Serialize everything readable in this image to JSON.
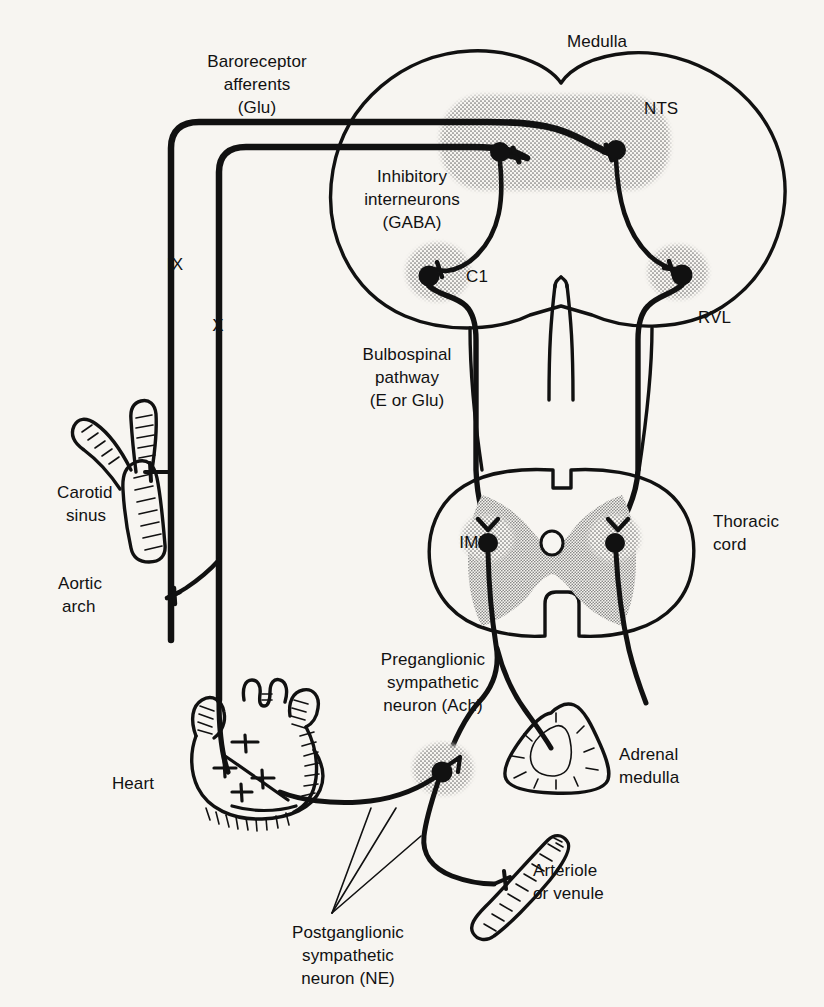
{
  "figure": {
    "background_color": "#f7f5f1",
    "ink_color": "#111111",
    "stipple_color": "#8a8a8a"
  },
  "labels": {
    "medulla": "Medulla",
    "nts": "NTS",
    "rvl": "RVL",
    "c1": "C1",
    "iml": "IML",
    "ix": "IX",
    "x": "X",
    "baroreceptor_afferents_line1": "Baroreceptor",
    "baroreceptor_afferents_line2": "afferents",
    "baroreceptor_afferents_line3": "(Glu)",
    "inhibitory_line1": "Inhibitory",
    "inhibitory_line2": "interneurons",
    "inhibitory_line3": "(GABA)",
    "bulbospinal_line1": "Bulbospinal",
    "bulbospinal_line2": "pathway",
    "bulbospinal_line3": "(E or Glu)",
    "carotid_line1": "Carotid",
    "carotid_line2": "sinus",
    "aortic_line1": "Aortic",
    "aortic_line2": "arch",
    "thoracic_line1": "Thoracic",
    "thoracic_line2": "cord",
    "heart": "Heart",
    "preganglionic_line1": "Preganglionic",
    "preganglionic_line2": "sympathetic",
    "preganglionic_line3": "neuron (Ach)",
    "postganglionic_line1": "Postganglionic",
    "postganglionic_line2": "sympathetic",
    "postganglionic_line3": "neuron (NE)",
    "adrenal_line1": "Adrenal",
    "adrenal_line2": "medulla",
    "arteriole_line1": "Arteriole",
    "arteriole_line2": "or venule"
  },
  "structures": [
    {
      "name": "medulla",
      "kind": "brain-section",
      "label": "Medulla"
    },
    {
      "name": "nucleus-tractus-solitarius",
      "kind": "nucleus",
      "label": "NTS",
      "shaded": true
    },
    {
      "name": "rostral-ventrolateral-medulla",
      "kind": "region",
      "label": "RVL"
    },
    {
      "name": "c1-cell-group",
      "kind": "nucleus",
      "label": "C1",
      "shaded": true
    },
    {
      "name": "thoracic-cord",
      "kind": "cord-section",
      "label": "Thoracic cord"
    },
    {
      "name": "intermediolateral-cell-column",
      "kind": "nucleus",
      "label": "IML",
      "shaded": true
    },
    {
      "name": "glossopharyngeal-ganglion",
      "kind": "ganglion",
      "label": "IX",
      "shaded": true
    },
    {
      "name": "vagal-ganglion",
      "kind": "ganglion",
      "label": "X",
      "shaded": true
    },
    {
      "name": "carotid-sinus",
      "kind": "vessel",
      "label": "Carotid sinus"
    },
    {
      "name": "aortic-arch",
      "kind": "vessel",
      "label": "Aortic arch"
    },
    {
      "name": "heart",
      "kind": "organ",
      "label": "Heart"
    },
    {
      "name": "adrenal-medulla",
      "kind": "organ",
      "label": "Adrenal medulla"
    },
    {
      "name": "arteriole-or-venule",
      "kind": "vessel",
      "label": "Arteriole or venule"
    },
    {
      "name": "sympathetic-ganglion",
      "kind": "ganglion",
      "label": "",
      "shaded": true
    }
  ],
  "pathways": [
    {
      "name": "baroreceptor-afferents",
      "transmitter": "Glu",
      "from": "carotid sinus / aortic arch",
      "to": "NTS"
    },
    {
      "name": "inhibitory-interneurons",
      "transmitter": "GABA",
      "from": "NTS",
      "to": "C1 / RVL"
    },
    {
      "name": "bulbospinal-pathway",
      "transmitter": "E or Glu",
      "from": "RVL",
      "to": "IML"
    },
    {
      "name": "preganglionic-sympathetic-neuron",
      "transmitter": "Ach",
      "from": "IML",
      "to": "sympathetic ganglion / adrenal medulla"
    },
    {
      "name": "postganglionic-sympathetic-neuron",
      "transmitter": "NE",
      "from": "sympathetic ganglion",
      "to": "heart / arteriole or venule"
    }
  ]
}
